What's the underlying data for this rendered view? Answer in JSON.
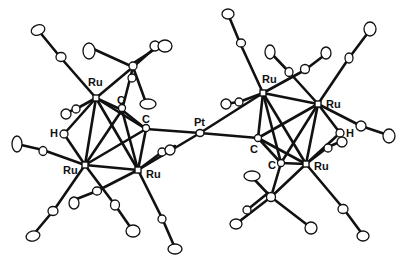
{
  "figure": {
    "type": "ORTEP molecular structure",
    "background": "#ffffff",
    "ink": "#111111",
    "labels": {
      "ru_left_top": "Ru",
      "ru_left_bottom": "Ru",
      "ru_left_right": "Ru",
      "c_left_upper": "C",
      "c_left_bridge": "C",
      "h_left": "H",
      "pt_center": "Pt",
      "ru_right_top": "Ru",
      "ru_right_right": "Ru",
      "ru_right_bottom": "Ru",
      "c_right_bridge": "C",
      "c_right_lower": "C",
      "h_right": "H"
    }
  }
}
